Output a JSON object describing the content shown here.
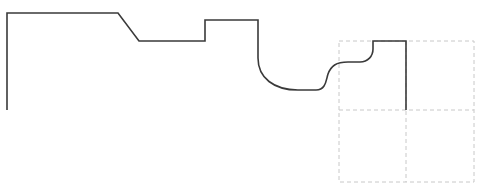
{
  "diagram": {
    "type": "profile-outline",
    "profile_color": "#3a3a3a",
    "grid_color": "#c8c8c8",
    "profile_path": "M7,110 L7,13 L118,13 L139,41 L205,41 L205,20 L258,20 L258,58 C258,78 274,90 298,90 L316,90 C326,90 326,80 328,74 C331,66 336,62 348,62 L360,62 C368,62 373,56 373,49 L373,41 L406,41 L406,110",
    "grid": {
      "x": 339,
      "y": 41,
      "width": 135,
      "height": 141,
      "mid_x": 406,
      "mid_y": 110
    }
  }
}
